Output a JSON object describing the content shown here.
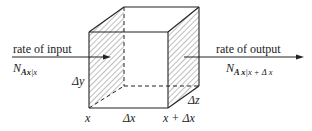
{
  "diagram": {
    "type": "control-volume-cube",
    "input": {
      "label": "rate of input",
      "flux_symbol": "N",
      "flux_sub_species": "Ax",
      "flux_sub_eval": "|x"
    },
    "output": {
      "label": "rate of output",
      "flux_symbol": "N",
      "flux_sub_species": "A x",
      "flux_sub_eval": "|x + Δ x"
    },
    "dimensions": {
      "dy": "Δy",
      "dz": "Δz",
      "dx": "Δx"
    },
    "positions": {
      "left": "x",
      "right": "x + Δx"
    }
  }
}
